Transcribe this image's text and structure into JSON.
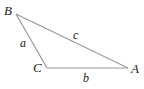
{
  "diagram": {
    "type": "triangle",
    "stroke_color": "#9a9a9a",
    "label_color": "#222222",
    "vertices": [
      {
        "name": "B",
        "x": 16,
        "y": 14,
        "label_x": 4,
        "label_y": 15
      },
      {
        "name": "C",
        "x": 47,
        "y": 68,
        "label_x": 33,
        "label_y": 72
      },
      {
        "name": "A",
        "x": 128,
        "y": 68,
        "label_x": 131,
        "label_y": 73
      }
    ],
    "sides": [
      {
        "name": "a",
        "from": "B",
        "to": "C",
        "label_x": 20,
        "label_y": 47
      },
      {
        "name": "c",
        "from": "B",
        "to": "A",
        "label_x": 73,
        "label_y": 39
      },
      {
        "name": "b",
        "from": "C",
        "to": "A",
        "label_x": 83,
        "label_y": 82
      }
    ]
  }
}
